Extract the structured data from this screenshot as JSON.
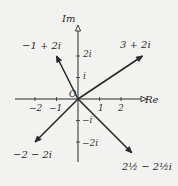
{
  "diagram": {
    "type": "argand-diagram",
    "axes": {
      "real_label": "Re",
      "imag_label": "Im",
      "origin_label": "O",
      "real_ticks": [
        {
          "value": -2,
          "label": "−2"
        },
        {
          "value": -1,
          "label": "−1"
        },
        {
          "value": 1,
          "label": "1"
        },
        {
          "value": 2,
          "label": "2"
        }
      ],
      "imag_ticks": [
        {
          "value": 2,
          "label": "2i"
        },
        {
          "value": 1,
          "label": "i"
        },
        {
          "value": -1,
          "label": "−i"
        },
        {
          "value": -2,
          "label": "−2i"
        }
      ]
    },
    "vectors": [
      {
        "name": "vector-3-plus-2i",
        "re": 3,
        "im": 2,
        "label": "3 + 2i"
      },
      {
        "name": "vector-minus1-plus-2i",
        "re": -1,
        "im": 2,
        "label": "−1 + 2i"
      },
      {
        "name": "vector-minus2-minus-2i",
        "re": -2,
        "im": -2,
        "label": "−2 − 2i"
      },
      {
        "name": "vector-2half-minus-2half-i",
        "re": 2.5,
        "im": -2.5,
        "label": "2½ − 2½i"
      }
    ],
    "colors": {
      "ink": "#2a2a2a",
      "paper": "#f2f2f0"
    }
  }
}
